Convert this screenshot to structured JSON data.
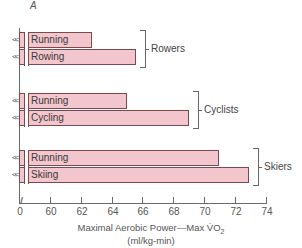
{
  "chart_data": {
    "type": "bar",
    "orientation": "horizontal",
    "panel_label": "A",
    "title": "",
    "xlabel": "Maximal Aerobic Power—Max V̇O2",
    "xlabel_units": "(ml/kg-min)",
    "ylabel": "",
    "xlim": [
      58,
      74
    ],
    "axis_break": true,
    "axis_origin_label": "0",
    "x_ticks": [
      60,
      62,
      64,
      66,
      68,
      70,
      72,
      74
    ],
    "grid": false,
    "legend": null,
    "groups": [
      {
        "name": "Rowers",
        "bars": [
          {
            "label": "Running",
            "value": 62.7
          },
          {
            "label": "Rowing",
            "value": 65.6
          }
        ]
      },
      {
        "name": "Cyclists",
        "bars": [
          {
            "label": "Running",
            "value": 65.0
          },
          {
            "label": "Cycling",
            "value": 69.0
          }
        ]
      },
      {
        "name": "Skiers",
        "bars": [
          {
            "label": "Running",
            "value": 71.0
          },
          {
            "label": "Skiing",
            "value": 72.9
          }
        ]
      }
    ],
    "colors": {
      "bar_fill": "#f2c6cc",
      "bar_border": "#7a4a50",
      "axis": "#6a6a6a"
    }
  },
  "labels": {
    "panel": "A",
    "origin": "0",
    "xlabel_main": "Maximal Aerobic Power—Max V̇O",
    "xlabel_sub": "2",
    "xlabel_units": "(ml/kg-min)",
    "break_glyph": "//",
    "zig_glyph": "<<"
  }
}
